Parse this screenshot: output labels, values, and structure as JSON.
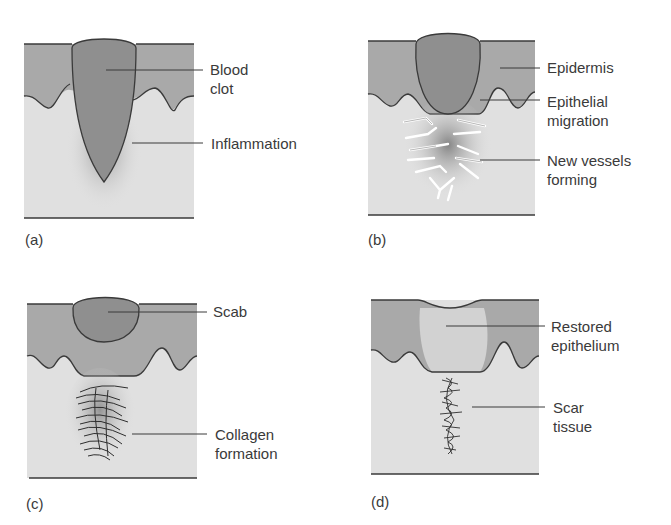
{
  "figure": {
    "colors": {
      "epidermis": "#a9a9a9",
      "dermis": "#e0e0e0",
      "clot": "#8f8f8f",
      "outline": "#3a3a3a",
      "restored": "#d4d4d4"
    },
    "panels": [
      {
        "id": "a",
        "tag": "(a)",
        "labels": [
          "Blood\nclot",
          "Inflammation"
        ]
      },
      {
        "id": "b",
        "tag": "(b)",
        "labels": [
          "Epidermis",
          "Epithelial\nmigration",
          "New vessels\nforming"
        ]
      },
      {
        "id": "c",
        "tag": "(c)",
        "labels": [
          "Scab",
          "Collagen\nformation"
        ]
      },
      {
        "id": "d",
        "tag": "(d)",
        "labels": [
          "Restored\nepithelium",
          "Scar\ntissue"
        ]
      }
    ]
  }
}
